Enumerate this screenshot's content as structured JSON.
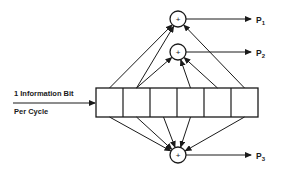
{
  "input": {
    "line1": "1 Information Bit",
    "line2": "Per Cycle"
  },
  "register": {
    "cells": 6
  },
  "adders": [
    {
      "id": "p1",
      "symbol": "+",
      "output_label": "P",
      "output_sub": "1",
      "taps": [
        1,
        2,
        6
      ]
    },
    {
      "id": "p2",
      "symbol": "+",
      "output_label": "P",
      "output_sub": "2",
      "taps": [
        2,
        4,
        5
      ]
    },
    {
      "id": "p3",
      "symbol": "+",
      "output_label": "P",
      "output_sub": "3",
      "taps": [
        1,
        2,
        3,
        4,
        6
      ]
    }
  ],
  "colors": {
    "stroke": "#1a1a1a",
    "background": "#ffffff"
  }
}
